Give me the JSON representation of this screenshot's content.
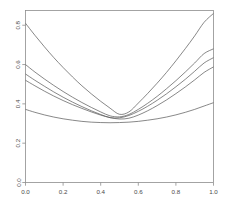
{
  "chart_data": {
    "type": "line",
    "title": "",
    "subtitle": "",
    "xlabel": "",
    "ylabel": "",
    "xlim": [
      0.0,
      1.0
    ],
    "ylim": [
      0.0,
      0.875
    ],
    "grid": false,
    "legend": false,
    "legend_position": "none",
    "x_ticks": [
      0.0,
      0.2,
      0.4,
      0.6,
      0.8,
      1.0
    ],
    "x_tick_labels": [
      "0.0",
      "0.2",
      "0.4",
      "0.6",
      "0.8",
      "1.0"
    ],
    "y_ticks": [
      0.0,
      0.2,
      0.4,
      0.6,
      0.8
    ],
    "y_tick_labels": [
      "0.0",
      "0.2",
      "0.4",
      "0.6",
      "0.8"
    ],
    "y_tick_rotation": 90,
    "line_color": "#555555",
    "line_width": 0.7,
    "frame_color": "#8d8d8d",
    "background": "#ffffff",
    "x": [
      0.0,
      0.05,
      0.1,
      0.15,
      0.2,
      0.25,
      0.3,
      0.35,
      0.4,
      0.45,
      0.5,
      0.55,
      0.6,
      0.65,
      0.7,
      0.75,
      0.8,
      0.85,
      0.9,
      0.95,
      1.0
    ],
    "series": [
      {
        "name": "curve-1",
        "values": [
          0.81,
          0.749,
          0.691,
          0.636,
          0.585,
          0.537,
          0.492,
          0.451,
          0.413,
          0.378,
          0.347,
          0.359,
          0.404,
          0.453,
          0.505,
          0.56,
          0.619,
          0.681,
          0.746,
          0.815,
          0.86
        ]
      },
      {
        "name": "curve-2",
        "values": [
          0.6,
          0.562,
          0.527,
          0.494,
          0.463,
          0.434,
          0.407,
          0.382,
          0.359,
          0.339,
          0.334,
          0.346,
          0.372,
          0.403,
          0.438,
          0.477,
          0.518,
          0.562,
          0.608,
          0.656,
          0.68
        ]
      },
      {
        "name": "curve-3",
        "values": [
          0.552,
          0.52,
          0.49,
          0.461,
          0.434,
          0.409,
          0.386,
          0.365,
          0.346,
          0.33,
          0.329,
          0.341,
          0.362,
          0.388,
          0.418,
          0.451,
          0.487,
          0.525,
          0.566,
          0.608,
          0.635
        ]
      },
      {
        "name": "curve-4",
        "values": [
          0.52,
          0.492,
          0.465,
          0.44,
          0.417,
          0.396,
          0.377,
          0.359,
          0.343,
          0.33,
          0.323,
          0.327,
          0.343,
          0.365,
          0.391,
          0.42,
          0.452,
          0.486,
          0.522,
          0.56,
          0.588
        ]
      },
      {
        "name": "curve-5",
        "values": [
          0.372,
          0.357,
          0.344,
          0.333,
          0.324,
          0.317,
          0.311,
          0.307,
          0.305,
          0.304,
          0.305,
          0.307,
          0.311,
          0.317,
          0.324,
          0.333,
          0.344,
          0.357,
          0.372,
          0.389,
          0.406
        ]
      }
    ]
  }
}
